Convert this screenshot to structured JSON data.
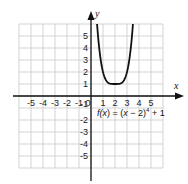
{
  "chart_data": {
    "type": "line",
    "title": "",
    "function": "f(x) = (x − 2)^4 + 1",
    "label": {
      "prefix": "f(",
      "var": "x",
      "mid": ") = (",
      "var2": "x",
      "rest": " − 2)",
      "exp": "4",
      "suffix": " + 1"
    },
    "xlabel": "x",
    "ylabel": "y",
    "xlim": [
      -6,
      6
    ],
    "ylim": [
      -6,
      6
    ],
    "grid": true,
    "x_ticks": [
      -5,
      -4,
      -3,
      -2,
      -1,
      0,
      1,
      2,
      3,
      4,
      5
    ],
    "y_ticks": [
      -5,
      -4,
      -3,
      -2,
      -1,
      1,
      2,
      3,
      4,
      5
    ],
    "x_tick_labels": [
      "-5",
      "-4",
      "-3",
      "-2",
      "-1",
      "0",
      "1",
      "2",
      "3",
      "4",
      "5"
    ],
    "y_tick_labels": [
      "-5",
      "-4",
      "-3",
      "-2",
      "-1",
      "1",
      "2",
      "3",
      "4",
      "5"
    ],
    "series": [
      {
        "name": "f(x) = (x − 2)^4 + 1",
        "x": [
          0.5,
          0.75,
          1.0,
          1.25,
          1.5,
          1.75,
          2.0,
          2.25,
          2.5,
          2.75,
          3.0,
          3.25,
          3.5
        ],
        "y": [
          6.06,
          3.44,
          2.0,
          1.32,
          1.06,
          1.0,
          1.0,
          1.0,
          1.06,
          1.32,
          2.0,
          3.44,
          6.06
        ]
      }
    ],
    "vertex": [
      2,
      1
    ]
  },
  "colors": {
    "grid": "#c8c8c8",
    "axis": "#111111",
    "curve": "#111111"
  }
}
